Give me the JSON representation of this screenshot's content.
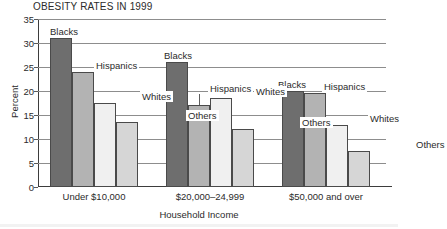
{
  "chart_data": {
    "type": "bar",
    "title": "OBESITY RATES IN 1999",
    "xlabel": "Household Income",
    "ylabel": "Percent",
    "categories": [
      "Under $10,000",
      "$20,000–24,999",
      "$50,000 and over"
    ],
    "series": [
      {
        "name": "Blacks",
        "color": "#6e6e6e",
        "values": [
          31,
          26,
          20
        ]
      },
      {
        "name": "Hispanics",
        "color": "#b3b3b3",
        "values": [
          24,
          17,
          19.5
        ]
      },
      {
        "name": "Whites",
        "color": "#f0f0f0",
        "values": [
          17.5,
          18.5,
          13
        ]
      },
      {
        "name": "Others",
        "color": "#d6d6d6",
        "values": [
          13.5,
          12,
          7.5
        ]
      }
    ],
    "ylim": [
      0,
      35
    ],
    "yticks": [
      0,
      5,
      10,
      15,
      20,
      25,
      30,
      35
    ],
    "ytick_labels": [
      "0",
      "5",
      "10",
      "15",
      "20",
      "25",
      "30",
      "35"
    ],
    "grid": true,
    "legend": "in-chart labels above bars"
  },
  "labels": {
    "group0": {
      "blacks": "Blacks",
      "hispanics": "Hispanics",
      "whites": "Whites",
      "others": "Others"
    },
    "group1": {
      "blacks": "Blacks",
      "hispanics": "Hispanics",
      "whites": "Whites",
      "others": "Others"
    },
    "group2": {
      "blacks": "Blacks",
      "hispanics": "Hispanics",
      "whites": "Whites",
      "others": "Others"
    }
  }
}
